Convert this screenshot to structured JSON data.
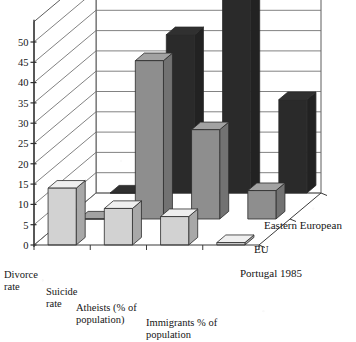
{
  "chart_data": {
    "type": "bar",
    "title": "",
    "subtitle": "",
    "xlabel": "",
    "ylabel": "",
    "ylim": [
      0,
      55
    ],
    "yticks": [
      0,
      5,
      10,
      15,
      20,
      25,
      30,
      35,
      40,
      45,
      50
    ],
    "grid": true,
    "three_d": true,
    "legend_position": "right-depth-axis",
    "categories": [
      "Divorce rate",
      "Suicide rate",
      "Atheists (% of population)",
      "Immigrants  % of population"
    ],
    "category_lines": [
      [
        "Divorce",
        "rate"
      ],
      [
        "Suicide",
        "rate"
      ],
      [
        "Atheists (% of",
        "population)"
      ],
      [
        "Immigrants  % of",
        "population"
      ]
    ],
    "series": [
      {
        "name": "Portugal 1985",
        "color": "#d2d2d2",
        "values": [
          14,
          9,
          7,
          0.6
        ]
      },
      {
        "name": "EU",
        "color": "#8e8e8e",
        "values": [
          0,
          39,
          22,
          7
        ]
      },
      {
        "name": "Eastern European",
        "color": "#2a2a2a",
        "values": [
          0,
          39,
          53,
          23
        ]
      }
    ]
  },
  "axis": {
    "tick_labels": [
      "50",
      "45",
      "40",
      "35",
      "30",
      "25",
      "20",
      "15",
      "10",
      "5",
      "0"
    ]
  },
  "legend": {
    "items": [
      {
        "label": "Eastern European",
        "color": "#2a2a2a"
      },
      {
        "label": "EU",
        "color": "#8e8e8e"
      },
      {
        "label": "Portugal 1985",
        "color": "#d2d2d2"
      }
    ]
  },
  "colors": {
    "bar_portugal": "#d2d2d2",
    "bar_eu": "#8e8e8e",
    "bar_eastern": "#2a2a2a",
    "axis_line": "#4a4a4a",
    "grid_line": "#6b6b6b",
    "floor": "#ffffff",
    "background": "#ffffff"
  }
}
